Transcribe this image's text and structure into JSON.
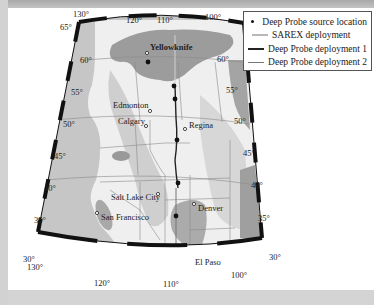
{
  "legend": {
    "items": [
      {
        "label": "Deep Probe source location",
        "symbol": "dot",
        "color": "#111111"
      },
      {
        "label": "SAREX deployment",
        "symbol": "line",
        "color": "#b8b8b8"
      },
      {
        "label": "Deep Probe deployment 1",
        "symbol": "line",
        "color": "#222222"
      },
      {
        "label": "Deep Probe deployment 2",
        "symbol": "line",
        "color": "#777777"
      }
    ]
  },
  "map": {
    "longitude_labels_top": [
      "130°",
      "120°",
      "110°",
      "100°"
    ],
    "longitude_labels_bottom": [
      "130°",
      "120°",
      "110°",
      "100°"
    ],
    "latitude_labels_left": [
      "65°",
      "60°",
      "55°",
      "50°",
      "45°",
      "40°",
      "35°",
      "30°"
    ],
    "latitude_labels_right": [
      "65°",
      "60°",
      "55°",
      "50°",
      "45°",
      "40°",
      "35°",
      "30°"
    ],
    "cities": [
      {
        "name": "Yellowknife"
      },
      {
        "name": "Edmonton"
      },
      {
        "name": "Calgary"
      },
      {
        "name": "Regina"
      },
      {
        "name": "Salt Lake City"
      },
      {
        "name": "Denver"
      },
      {
        "name": "San Francisco"
      },
      {
        "name": "El Paso"
      }
    ],
    "colors": {
      "land": "#efefef",
      "ocean": "#bdbdbd",
      "dark_region": "#9a9a9a",
      "light_region": "#cfcfcf",
      "border": "#8a8a8a"
    }
  }
}
